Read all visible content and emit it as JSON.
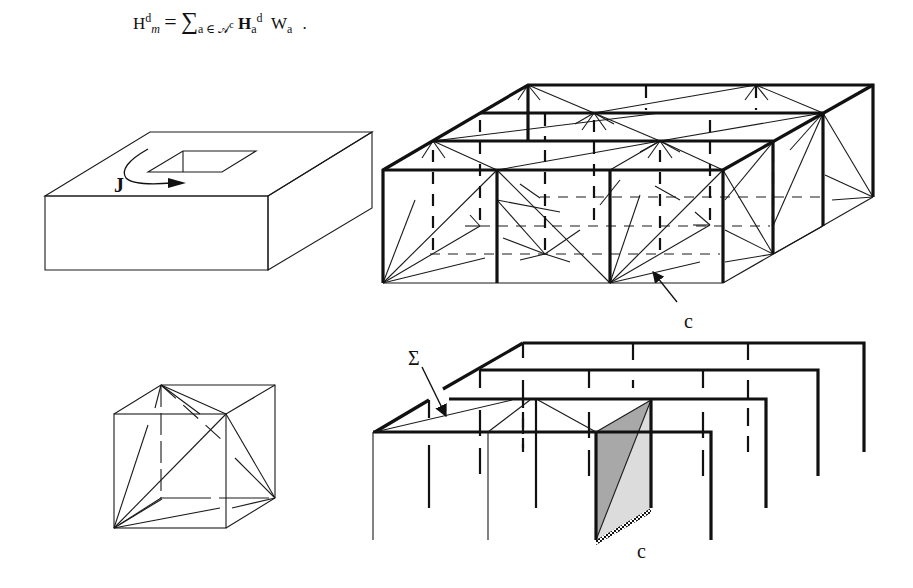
{
  "formula": {
    "lhs_base": "H",
    "lhs_sup": "d",
    "lhs_sub": "m",
    "equals": "=",
    "sum_symbol": "∑",
    "sum_index": "a ∈ 𝒜",
    "sum_index_sup": "c",
    "term_base": "H",
    "term_sub": "a",
    "term_sup": "d",
    "weight_base": "W",
    "weight_sub": "a",
    "trailing": "."
  },
  "figures": {
    "slab": {
      "current_label": "J"
    },
    "lattice": {
      "cell_label": "c"
    },
    "cell": {},
    "planes": {
      "surface_label": "Σ",
      "cell_label": "c",
      "shade_dark": "#a8a8a8",
      "shade_light": "#dcdcdc"
    }
  }
}
